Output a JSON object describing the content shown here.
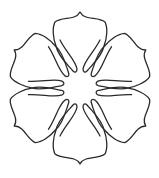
{
  "figure": {
    "petal_count": 6,
    "stroke_color": "#2a2a2a",
    "background_color": "#ffffff",
    "center": [
      80,
      88
    ]
  }
}
